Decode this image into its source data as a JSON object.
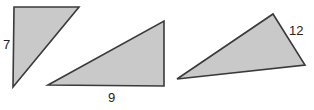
{
  "figure": {
    "fill_color": "#c9c9c9",
    "stroke_color": "#3a3a3a",
    "triangles": [
      {
        "name": "left-triangle",
        "points": "14,7 79,7 13,87",
        "label": "7",
        "label_x": 3,
        "label_y": 49
      },
      {
        "name": "middle-triangle",
        "points": "48,85 164,21 164,86",
        "label": "9",
        "label_x": 108,
        "label_y": 102
      },
      {
        "name": "right-triangle",
        "points": "177,79 273,14 305,65",
        "label": "12",
        "label_x": 289,
        "label_y": 35
      }
    ]
  }
}
